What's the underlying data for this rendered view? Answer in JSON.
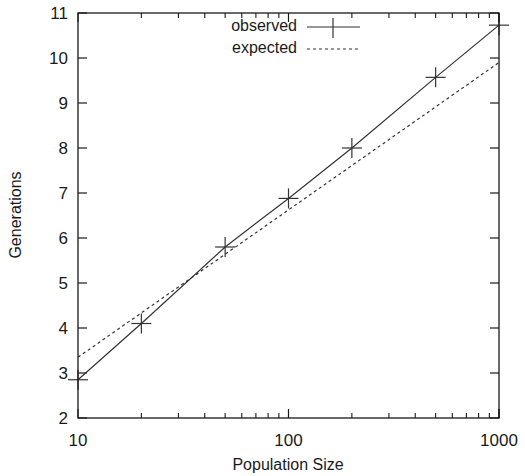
{
  "chart_data": {
    "type": "line",
    "title": "",
    "xlabel": "Population Size",
    "ylabel": "Generations",
    "xscale": "log",
    "xlim": [
      10,
      1000
    ],
    "ylim": [
      2,
      11
    ],
    "xticks": [
      "10",
      "100",
      "1000"
    ],
    "yticks": [
      "2",
      "3",
      "4",
      "5",
      "6",
      "7",
      "8",
      "9",
      "10",
      "11"
    ],
    "grid": false,
    "legend_position": "top-center-inside",
    "series": [
      {
        "name": "observed",
        "style": "solid line with plus markers",
        "x": [
          10,
          20,
          50,
          100,
          200,
          500,
          1000
        ],
        "y": [
          2.85,
          4.1,
          5.8,
          6.88,
          8.0,
          9.57,
          10.73
        ]
      },
      {
        "name": "expected",
        "style": "dashed line",
        "x": [
          10,
          1000
        ],
        "y": [
          3.35,
          9.9
        ]
      }
    ]
  },
  "legend": {
    "observed_label": "observed",
    "expected_label": "expected"
  },
  "axes": {
    "xlabel": "Population Size",
    "ylabel": "Generations"
  }
}
